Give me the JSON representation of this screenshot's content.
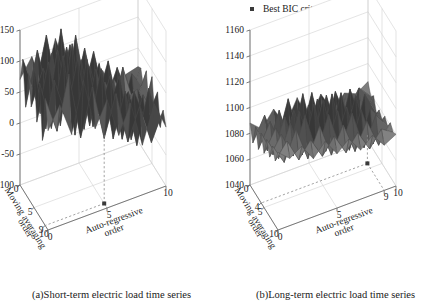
{
  "figure": {
    "legend": {
      "label": "Best BIC criterion",
      "marker": "square-dot",
      "marker_color": "#3a3a3a"
    },
    "panels": [
      {
        "id": "a",
        "caption": "(a)Short-term electric load time series",
        "zlabel": "BIC criterion",
        "xlabel": "Auto-regressive order",
        "ylabel": "Moving averaging order",
        "zticks": [
          "150",
          "100",
          "50",
          "0",
          "-50",
          "-100"
        ],
        "xticks": [
          "0",
          "5",
          "10"
        ],
        "yticks": [
          "0",
          "5",
          "9",
          "10"
        ],
        "best_point": {
          "ar_order": 5,
          "ma_order": 9,
          "label": "Best BIC criterion"
        }
      },
      {
        "id": "b",
        "caption": "(b)Long-term electric load time series",
        "zlabel": "BIC criterion",
        "xlabel": "Auto-regressive order",
        "ylabel": "Moving averaging order",
        "zticks": [
          "1160",
          "1140",
          "1120",
          "1100",
          "1080",
          "1060",
          "1040"
        ],
        "xticks": [
          "0",
          "5",
          "9",
          "10"
        ],
        "yticks": [
          "0",
          "4",
          "5",
          "10"
        ],
        "best_point": {
          "ar_order": 9,
          "ma_order": 4,
          "label": "Best BIC criterion"
        }
      }
    ]
  },
  "chart_data": [
    {
      "type": "surface",
      "panel": "a",
      "title": "(a)Short-term electric load time series",
      "xlabel": "Auto-regressive order",
      "ylabel": "Moving averaging order",
      "zlabel": "BIC criterion",
      "xlim": [
        0,
        10
      ],
      "ylim": [
        0,
        10
      ],
      "zlim": [
        -100,
        150
      ],
      "x": [
        0,
        1,
        2,
        3,
        4,
        5,
        6,
        7,
        8,
        9,
        10
      ],
      "y": [
        0,
        1,
        2,
        3,
        4,
        5,
        6,
        7,
        8,
        9,
        10
      ],
      "grid": true,
      "best": {
        "x": 5,
        "y": 9,
        "z": -100
      },
      "z": [
        [
          60,
          95,
          40,
          120,
          35,
          75,
          10,
          55,
          -20,
          40,
          -5
        ],
        [
          105,
          45,
          130,
          20,
          95,
          5,
          70,
          -15,
          35,
          -30,
          15
        ],
        [
          30,
          120,
          55,
          140,
          25,
          110,
          -10,
          60,
          -35,
          50,
          -20
        ],
        [
          115,
          35,
          145,
          10,
          125,
          30,
          85,
          -25,
          45,
          -10,
          30
        ],
        [
          45,
          135,
          25,
          150,
          5,
          95,
          20,
          70,
          -40,
          25,
          -15
        ],
        [
          125,
          20,
          140,
          40,
          110,
          -5,
          60,
          15,
          30,
          -35,
          40
        ],
        [
          55,
          110,
          60,
          130,
          45,
          85,
          -15,
          50,
          10,
          20,
          -25
        ],
        [
          100,
          30,
          120,
          15,
          135,
          25,
          75,
          -20,
          55,
          -15,
          35
        ],
        [
          40,
          125,
          35,
          145,
          20,
          100,
          5,
          65,
          -30,
          30,
          0
        ],
        [
          110,
          50,
          135,
          30,
          105,
          10,
          80,
          -10,
          40,
          -20,
          25
        ],
        [
          70,
          100,
          45,
          115,
          55,
          60,
          25,
          35,
          -5,
          15,
          20
        ]
      ]
    },
    {
      "type": "surface",
      "panel": "b",
      "title": "(b)Long-term electric load time series",
      "xlabel": "Auto-regressive order",
      "ylabel": "Moving averaging order",
      "zlabel": "BIC criterion",
      "xlim": [
        0,
        10
      ],
      "ylim": [
        0,
        10
      ],
      "zlim": [
        1040,
        1160
      ],
      "x": [
        0,
        1,
        2,
        3,
        4,
        5,
        6,
        7,
        8,
        9,
        10
      ],
      "y": [
        0,
        1,
        2,
        3,
        4,
        5,
        6,
        7,
        8,
        9,
        10
      ],
      "grid": true,
      "best": {
        "x": 9,
        "y": 4,
        "z": 1040
      },
      "z": [
        [
          1100,
          1092,
          1098,
          1085,
          1095,
          1082,
          1090,
          1078,
          1086,
          1075,
          1080
        ],
        [
          1090,
          1102,
          1084,
          1096,
          1080,
          1092,
          1076,
          1088,
          1072,
          1084,
          1078
        ],
        [
          1098,
          1082,
          1104,
          1078,
          1100,
          1074,
          1094,
          1070,
          1090,
          1068,
          1082
        ],
        [
          1086,
          1100,
          1080,
          1108,
          1076,
          1102,
          1072,
          1096,
          1066,
          1088,
          1076
        ],
        [
          1096,
          1078,
          1102,
          1074,
          1110,
          1070,
          1098,
          1064,
          1092,
          1062,
          1080
        ],
        [
          1082,
          1098,
          1076,
          1104,
          1072,
          1106,
          1068,
          1094,
          1060,
          1086,
          1074
        ],
        [
          1094,
          1074,
          1100,
          1070,
          1102,
          1066,
          1104,
          1062,
          1096,
          1058,
          1078
        ],
        [
          1078,
          1096,
          1072,
          1098,
          1068,
          1100,
          1064,
          1098,
          1056,
          1090,
          1072
        ],
        [
          1092,
          1070,
          1098,
          1066,
          1104,
          1062,
          1096,
          1060,
          1094,
          1064,
          1082
        ],
        [
          1076,
          1094,
          1068,
          1100,
          1064,
          1098,
          1058,
          1092,
          1066,
          1088,
          1078
        ],
        [
          1088,
          1080,
          1092,
          1076,
          1094,
          1072,
          1090,
          1074,
          1084,
          1080,
          1086
        ]
      ]
    }
  ]
}
